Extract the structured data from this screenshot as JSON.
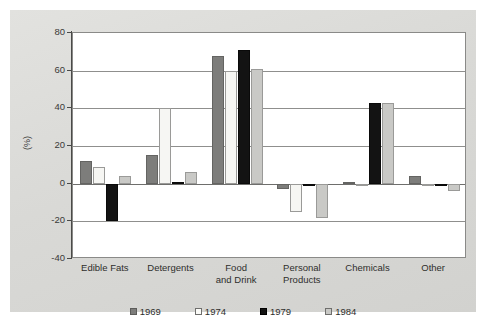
{
  "chart_data": {
    "type": "bar",
    "title": "",
    "xlabel": "",
    "ylabel": "(%)",
    "ylim": [
      -40,
      80
    ],
    "ytick_values": [
      80,
      60,
      40,
      20,
      0,
      -20,
      -40
    ],
    "ytick_labels": [
      "80",
      "60",
      "40",
      "20",
      "0",
      "-20",
      "-40"
    ],
    "grid": true,
    "legend_position": "bottom",
    "categories": [
      "Edible Fats",
      "Detergents",
      "Food and Drink",
      "Personal Products",
      "Chemicals",
      "Other"
    ],
    "category_lines": [
      [
        "Edible Fats"
      ],
      [
        "Detergents"
      ],
      [
        "Food",
        "and Drink"
      ],
      [
        "Personal",
        "Products"
      ],
      [
        "Chemicals"
      ],
      [
        "Other"
      ]
    ],
    "series": [
      {
        "name": "1969",
        "color": "#7d7d7b",
        "values": [
          12,
          15,
          68,
          -3,
          1,
          4
        ]
      },
      {
        "name": "1974",
        "color": "#f6f6f3",
        "values": [
          9,
          40,
          60,
          -15,
          0,
          0
        ]
      },
      {
        "name": "1979",
        "color": "#131313",
        "values": [
          -20,
          1,
          71,
          -1,
          43,
          -1
        ]
      },
      {
        "name": "1984",
        "color": "#c9c9c6",
        "values": [
          4,
          6,
          61,
          -18,
          43,
          -4
        ]
      }
    ]
  },
  "legend": {
    "items": [
      {
        "label": "1969",
        "swatch": "square-dark-gray-icon"
      },
      {
        "label": "1974",
        "swatch": "square-white-icon"
      },
      {
        "label": "1979",
        "swatch": "square-black-icon"
      },
      {
        "label": "1984",
        "swatch": "square-light-gray-icon"
      }
    ]
  },
  "colors": {
    "background": "#dcdcd9",
    "plot_background": "#ffffff",
    "gridline": "#8f8f8d",
    "axis": "#4a4a48",
    "text": "#2e2e2c"
  }
}
